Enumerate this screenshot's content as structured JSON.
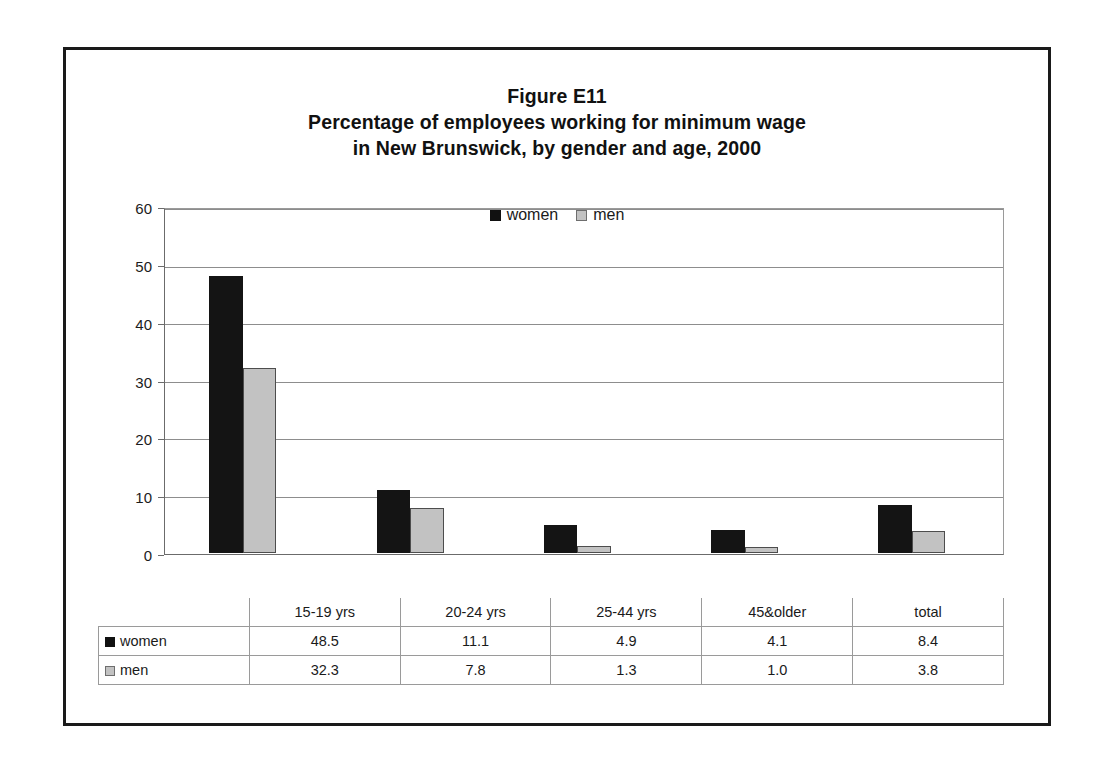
{
  "figure": {
    "title_lines": [
      "Figure E11",
      "Percentage of employees working for minimum wage",
      "in New Brunswick, by gender and age, 2000"
    ],
    "title_line_1": "Figure E11",
    "title_line_2": "Percentage of employees working for minimum wage",
    "title_line_3": "in New Brunswick, by gender and age, 2000"
  },
  "legend": {
    "position": "top-center",
    "entries": [
      {
        "label": "women",
        "color": "#141414",
        "icon": "legend-swatch-icon"
      },
      {
        "label": "men",
        "color": "#c2c2c2",
        "icon": "legend-swatch-icon"
      }
    ],
    "women_label": "women",
    "men_label": "men"
  },
  "axis": {
    "y_ticks": [
      "60",
      "50",
      "40",
      "30",
      "20",
      "10",
      "0"
    ],
    "y_min": 0,
    "y_max": 60,
    "y_step": 10
  },
  "table": {
    "header": [
      "",
      "15-19 yrs",
      "20-24 yrs",
      "25-44 yrs",
      "45&older",
      "total"
    ],
    "rows": [
      {
        "label": "women",
        "values": [
          "48.5",
          "11.1",
          "4.9",
          "4.1",
          "8.4"
        ]
      },
      {
        "label": "men",
        "values": [
          "32.3",
          "7.8",
          "1.3",
          "1.0",
          "3.8"
        ]
      }
    ],
    "col_1": "15-19 yrs",
    "col_2": "20-24 yrs",
    "col_3": "25-44 yrs",
    "col_4": "45&older",
    "col_5": "total",
    "women_label": "women",
    "men_label": "men",
    "women_v1": "48.5",
    "women_v2": "11.1",
    "women_v3": "4.9",
    "women_v4": "4.1",
    "women_v5": "8.4",
    "men_v1": "32.3",
    "men_v2": "7.8",
    "men_v3": "1.3",
    "men_v4": "1.0",
    "men_v5": "3.8"
  },
  "chart_data": {
    "type": "bar",
    "xlabel": "",
    "ylabel": "",
    "ylim": [
      0,
      60
    ],
    "ytick_step": 10,
    "grid": true,
    "legend_position": "top-center",
    "categories": [
      "15-19 yrs",
      "20-24 yrs",
      "25-44 yrs",
      "45&older",
      "total"
    ],
    "series": [
      {
        "name": "women",
        "color": "#141414",
        "values": [
          48.5,
          11.1,
          4.9,
          4.1,
          8.4
        ]
      },
      {
        "name": "men",
        "color": "#c2c2c2",
        "values": [
          32.3,
          7.8,
          1.3,
          1.0,
          3.8
        ]
      }
    ]
  }
}
